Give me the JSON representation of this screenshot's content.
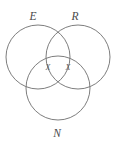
{
  "diagram": {
    "type": "venn-3-set",
    "background_color": "#ffffff",
    "stroke_color": "#6e6e6e",
    "label_color": "#4a4a4a",
    "mark_color": "#5a5a5a",
    "circles": [
      {
        "id": "set-e",
        "label": "E",
        "cx": 38,
        "cy": 57,
        "r": 32
      },
      {
        "id": "set-r",
        "label": "R",
        "cx": 78,
        "cy": 57,
        "r": 32
      },
      {
        "id": "set-n",
        "label": "N",
        "cx": 58,
        "cy": 88,
        "r": 32
      }
    ],
    "set_labels": [
      {
        "id": "label-e",
        "text": "E",
        "x": 33,
        "y": 20
      },
      {
        "id": "label-r",
        "text": "R",
        "x": 75,
        "y": 20
      },
      {
        "id": "label-n",
        "text": "N",
        "x": 57,
        "y": 137
      }
    ],
    "marks": [
      {
        "id": "mark-x-left",
        "text": "X",
        "x": 48,
        "y": 70,
        "region": "E-and-N"
      },
      {
        "id": "mark-x-right",
        "text": "X",
        "x": 68,
        "y": 70,
        "region": "R-and-N"
      }
    ]
  }
}
